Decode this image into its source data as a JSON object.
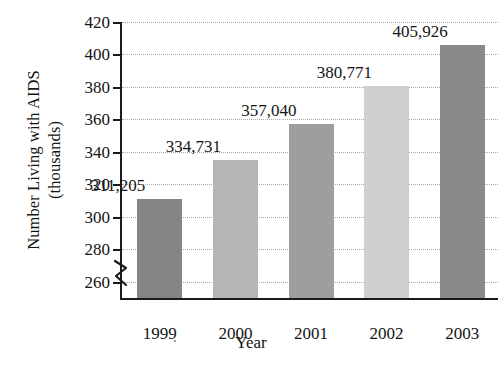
{
  "chart_data": {
    "type": "bar",
    "title": "",
    "xlabel": "Year",
    "ylabel_line1": "Number Living with AIDS",
    "ylabel_line2": "(thousands)",
    "categories": [
      "1999",
      "2000",
      "2001",
      "2002",
      "2003"
    ],
    "values": [
      311.205,
      334.731,
      357.04,
      380.771,
      405.926
    ],
    "data_labels": [
      "311,205",
      "334,731",
      "357,040",
      "380,771",
      "405,926"
    ],
    "bar_colors": [
      "#858585",
      "#b5b5b5",
      "#9e9e9e",
      "#cfcfcf",
      "#8a8a8a"
    ],
    "ylim": [
      250,
      420
    ],
    "ytick_labels": [
      "260",
      "280",
      "300",
      "320",
      "340",
      "360",
      "380",
      "400",
      "420"
    ],
    "ytick_values": [
      260,
      280,
      300,
      320,
      340,
      360,
      380,
      400,
      420
    ],
    "axis_break": true,
    "axis_break_note": "y-axis broken below 260",
    "grid": "horizontal-dotted",
    "legend": "none",
    "units": "thousands",
    "value_label_note": "bar data labels are raw counts of people living with AIDS"
  },
  "axis_colors": {
    "axis": "#1a1a1a",
    "grid": "#a8a8a8",
    "text": "#141414",
    "background": "#ffffff"
  }
}
